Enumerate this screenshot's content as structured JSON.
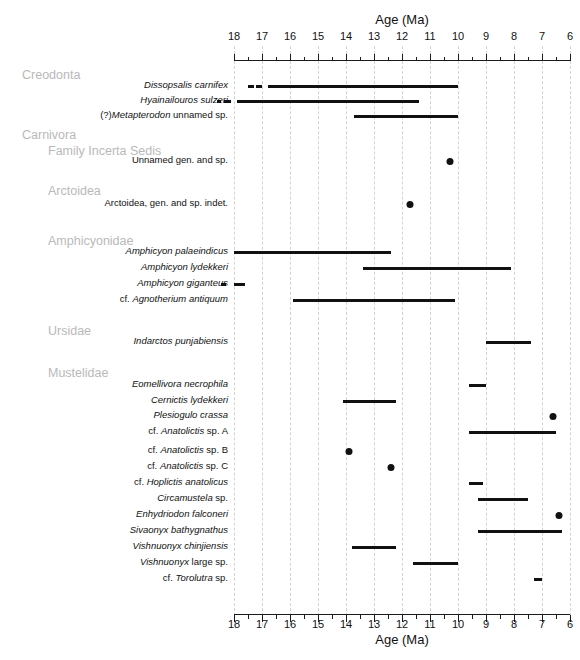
{
  "figure": {
    "top_watermark": "",
    "axis_title_top": "Age (Ma)",
    "axis_title_bottom": "Age (Ma)"
  },
  "axis": {
    "min": 6,
    "max": 18,
    "direction": "reversed",
    "major_ticks": [
      18,
      17,
      16,
      15,
      14,
      13,
      12,
      11,
      10,
      9,
      8,
      7,
      6
    ],
    "tick_labels": [
      "18",
      "17",
      "16",
      "15",
      "14",
      "13",
      "12",
      "11",
      "10",
      "9",
      "8",
      "7",
      "6"
    ],
    "minor_tick_step": 0.5,
    "unit": "Ma"
  },
  "groups": [
    {
      "label": "Creodonta",
      "indent": 0,
      "y": 68
    },
    {
      "label": "Carnivora",
      "indent": 0,
      "y": 128
    },
    {
      "label": "Family Incerta Sedis",
      "indent": 1,
      "y": 144
    },
    {
      "label": "Arctoidea",
      "indent": 1,
      "y": 184
    },
    {
      "label": "Amphicyonidae",
      "indent": 1,
      "y": 234
    },
    {
      "label": "Ursidae",
      "indent": 1,
      "y": 324
    },
    {
      "label": "Mustelidae",
      "indent": 1,
      "y": 366
    }
  ],
  "chart_data": {
    "type": "bar",
    "xlabel": "Age (Ma)",
    "ylabel": "",
    "xlim": [
      18,
      6
    ],
    "grid": true,
    "legend": "none",
    "orientation": "horizontal-range",
    "taxa": [
      {
        "name": "Dissopsalis carnifex",
        "italic": "Dissopsalis carnifex",
        "prefix": "",
        "suffix": "",
        "y": 85,
        "kind": "range",
        "start": 16.8,
        "end": 10.0,
        "dashes": [
          [
            17.5,
            17.3
          ],
          [
            17.2,
            17.0
          ]
        ]
      },
      {
        "name": "Hyainailouros sulzeri",
        "italic": "Hyainailouros sulzeri",
        "prefix": "",
        "suffix": "",
        "y": 100,
        "kind": "range",
        "start": 17.9,
        "end": 11.4,
        "dashes": [
          [
            18.6,
            18.45
          ],
          [
            18.35,
            18.1
          ]
        ]
      },
      {
        "name": "(?)Metapterodon unnamed sp.",
        "italic": "Metapterodon",
        "prefix": "(?)",
        "suffix": " unnamed sp.",
        "y": 115,
        "kind": "range",
        "start": 13.7,
        "end": 10.0,
        "dashes": []
      },
      {
        "name": "Unnamed gen. and sp.",
        "italic": "",
        "prefix": "Unnamed gen. and sp.",
        "suffix": "",
        "y": 160,
        "kind": "point",
        "at": 10.3
      },
      {
        "name": "Arctoidea, gen. and sp. indet.",
        "italic": "",
        "prefix": "Arctoidea, gen. and sp. indet.",
        "suffix": "",
        "y": 203,
        "kind": "point",
        "at": 11.7
      },
      {
        "name": "Amphicyon palaeindicus",
        "italic": "Amphicyon palaeindicus",
        "prefix": "",
        "suffix": "",
        "y": 251,
        "kind": "range",
        "start": 18.0,
        "end": 12.4,
        "dashes": []
      },
      {
        "name": "Amphicyon lydekkeri",
        "italic": "Amphicyon lydekkeri",
        "prefix": "",
        "suffix": "",
        "y": 267,
        "kind": "range",
        "start": 13.4,
        "end": 8.1,
        "dashes": []
      },
      {
        "name": "Amphicyon giganteus",
        "italic": "Amphicyon giganteus",
        "prefix": "",
        "suffix": "",
        "y": 283,
        "kind": "range",
        "start": 18.1,
        "end": 17.7,
        "dashes": [
          [
            18.45,
            18.3
          ]
        ]
      },
      {
        "name": "cf. Agnotherium antiquum",
        "italic": "Agnotherium antiquum",
        "prefix": "cf. ",
        "suffix": "",
        "y": 299,
        "kind": "range",
        "start": 15.9,
        "end": 10.1,
        "dashes": []
      },
      {
        "name": "Indarctos punjabiensis",
        "italic": "Indarctos punjabiensis",
        "prefix": "",
        "suffix": "",
        "y": 341,
        "kind": "range",
        "start": 9.0,
        "end": 7.4,
        "dashes": []
      },
      {
        "name": "Eomellivora necrophila",
        "italic": "Eomellivora necrophila",
        "prefix": "",
        "suffix": "",
        "y": 384,
        "kind": "range",
        "start": 9.6,
        "end": 9.0,
        "dashes": []
      },
      {
        "name": "Cernictis lydekkeri",
        "italic": "Cernictis lydekkeri",
        "prefix": "",
        "suffix": "",
        "y": 400,
        "kind": "range",
        "start": 14.1,
        "end": 12.2,
        "dashes": []
      },
      {
        "name": "Plesiogulo crassa",
        "italic": "Plesiogulo crassa",
        "prefix": "",
        "suffix": "",
        "y": 415,
        "kind": "point",
        "at": 6.6
      },
      {
        "name": "cf. Anatolictis sp. A",
        "italic": "Anatolictis",
        "prefix": "cf. ",
        "suffix": " sp. A",
        "y": 431,
        "kind": "range",
        "start": 9.6,
        "end": 6.5,
        "dashes": []
      },
      {
        "name": "cf. Anatolictis sp. B",
        "italic": "Anatolictis",
        "prefix": "cf. ",
        "suffix": " sp. B",
        "y": 450,
        "kind": "point",
        "at": 13.9
      },
      {
        "name": "cf. Anatolictis sp. C",
        "italic": "Anatolictis",
        "prefix": "cf. ",
        "suffix": " sp. C",
        "y": 466,
        "kind": "point",
        "at": 12.4
      },
      {
        "name": "cf. Hoplictis anatolicus",
        "italic": "Hoplictis anatolicus",
        "prefix": "cf. ",
        "suffix": "",
        "y": 482,
        "kind": "range",
        "start": 9.6,
        "end": 9.1,
        "dashes": []
      },
      {
        "name": "Circamustela  sp.",
        "italic": "Circamustela",
        "prefix": "",
        "suffix": "  sp.",
        "y": 498,
        "kind": "range",
        "start": 9.3,
        "end": 7.5,
        "dashes": []
      },
      {
        "name": "Enhydriodon falconeri",
        "italic": "Enhydriodon falconeri",
        "prefix": "",
        "suffix": "",
        "y": 514,
        "kind": "point",
        "at": 6.4
      },
      {
        "name": "Sivaonyx bathygnathus",
        "italic": "Sivaonyx bathygnathus",
        "prefix": "",
        "suffix": "",
        "y": 530,
        "kind": "range",
        "start": 9.3,
        "end": 6.3,
        "dashes": []
      },
      {
        "name": "Vishnuonyx chinjiensis",
        "italic": "Vishnuonyx chinjiensis",
        "prefix": "",
        "suffix": "",
        "y": 546,
        "kind": "range",
        "start": 13.8,
        "end": 12.2,
        "dashes": []
      },
      {
        "name": "Vishnuonyx large sp.",
        "italic": "Vishnuonyx",
        "prefix": "",
        "suffix": " large sp.",
        "y": 562,
        "kind": "range",
        "start": 11.6,
        "end": 10.0,
        "dashes": []
      },
      {
        "name": "cf. Torolutra sp.",
        "italic": "Torolutra",
        "prefix": "cf. ",
        "suffix": " sp.",
        "y": 578,
        "kind": "range",
        "start": 7.3,
        "end": 7.0,
        "dashes": []
      }
    ]
  }
}
